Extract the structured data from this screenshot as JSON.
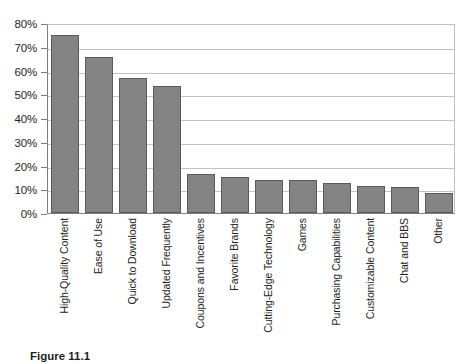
{
  "chart_data": {
    "type": "bar",
    "title": "",
    "xlabel": "",
    "ylabel": "",
    "ylim": [
      0,
      80
    ],
    "grid": true,
    "legend": false,
    "y_tick_labels": [
      "80%",
      "70%",
      "60%",
      "50%",
      "40%",
      "30%",
      "20%",
      "10%",
      "0%"
    ],
    "y_tick_values": [
      80,
      70,
      60,
      50,
      40,
      30,
      20,
      10,
      0
    ],
    "categories": [
      "High-Quality Content",
      "Ease of Use",
      "Quick to Download",
      "Updated Frequently",
      "Coupons and Incentives",
      "Favorite Brands",
      "Cutting-Edge Technology",
      "Games",
      "Purchasing Capabilities",
      "Customizable Content",
      "Chat and BBS",
      "Other"
    ],
    "values": [
      75,
      65.5,
      57,
      53.5,
      16.5,
      15,
      14,
      14,
      12.5,
      11.5,
      11,
      8.5
    ],
    "bar_fill_color": "#848484",
    "bar_border_color": "#5a5a5a",
    "gridline_color": "#c3c3c3",
    "axis_color": "#7f7f7f",
    "background_color": "#ffffff"
  },
  "caption": {
    "text": "Figure 11.1"
  }
}
